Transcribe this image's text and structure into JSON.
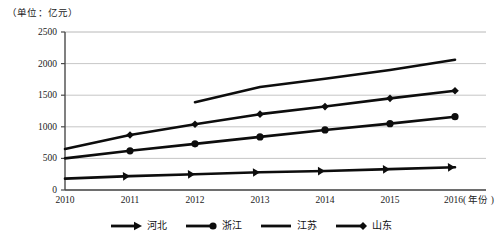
{
  "chart_data": {
    "type": "line",
    "title": "",
    "unit_note": "（单位：亿元）",
    "xlabel": "年份",
    "ylabel": "",
    "grid": true,
    "legend_position": "bottom",
    "ylim": [
      0,
      2500
    ],
    "yticks": [
      "0",
      "500",
      "1000",
      "1500",
      "2000",
      "2500"
    ],
    "ytick_values": [
      0,
      500,
      1000,
      1500,
      2000,
      2500
    ],
    "categories": [
      "2010",
      "2011",
      "2012",
      "2013",
      "2014",
      "2015",
      "2016"
    ],
    "xtick_labels": [
      "2010",
      "2011",
      "2012",
      "2013",
      "2014",
      "2015",
      "2016( 年份 )"
    ],
    "series": [
      {
        "name": "河北",
        "marker": "arrow",
        "x": [
          2010,
          2011,
          2012,
          2013,
          2014,
          2015,
          2016
        ],
        "values": [
          180,
          220,
          250,
          280,
          300,
          330,
          360
        ]
      },
      {
        "name": "浙江",
        "marker": "circle",
        "x": [
          2010,
          2011,
          2012,
          2013,
          2014,
          2015,
          2016
        ],
        "values": [
          500,
          620,
          730,
          840,
          950,
          1050,
          1160
        ]
      },
      {
        "name": "江苏",
        "marker": "none",
        "x": [
          2012,
          2013,
          2014,
          2015,
          2016
        ],
        "values": [
          1390,
          1630,
          1760,
          1900,
          2060
        ]
      },
      {
        "name": "山东",
        "marker": "diamond",
        "x": [
          2010,
          2011,
          2012,
          2013,
          2014,
          2015,
          2016
        ],
        "values": [
          650,
          870,
          1040,
          1200,
          1320,
          1450,
          1570
        ]
      }
    ],
    "legend": [
      {
        "label": "河北",
        "marker": "arrow"
      },
      {
        "label": "浙江",
        "marker": "circle"
      },
      {
        "label": "江苏",
        "marker": "none"
      },
      {
        "label": "山东",
        "marker": "diamond"
      }
    ],
    "colors": {
      "series_line": "#0d0d0d",
      "grid": "#b8b8b8",
      "axis": "#4a4a4a",
      "text": "#1a1a1a"
    }
  }
}
